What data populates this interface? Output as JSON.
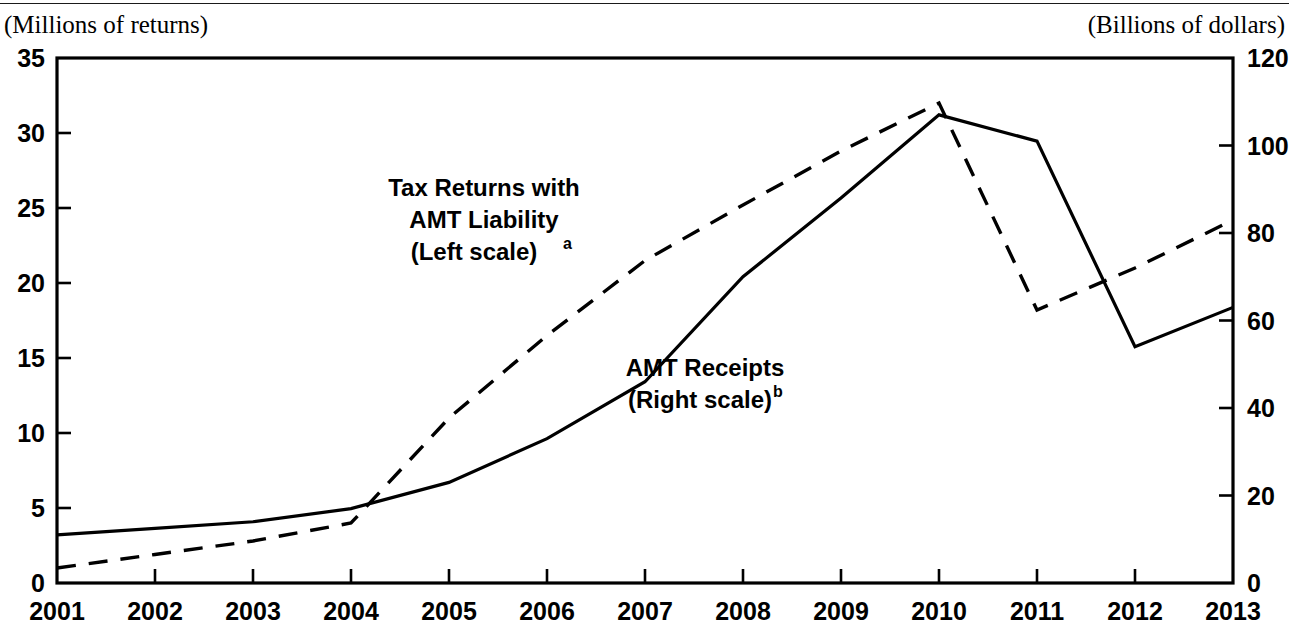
{
  "figure": {
    "left_axis_unit": "(Millions of returns)",
    "right_axis_unit": "(Billions of dollars)",
    "series_labels": {
      "dashed_line1": "Tax Returns with",
      "dashed_line2": "AMT Liability",
      "dashed_line3": "(Left scale)",
      "dashed_footnote": "a",
      "solid_line1": "AMT Receipts",
      "solid_line2": "(Right scale)",
      "solid_footnote": "b"
    }
  },
  "chart_data": {
    "type": "line",
    "title": "",
    "subtitle": "",
    "xlabel": "",
    "ylabel": "(Millions of returns)",
    "y2label": "(Billions of dollars)",
    "grid": false,
    "legend_position": "inline-annotation",
    "x": [
      2001,
      2002,
      2003,
      2004,
      2005,
      2006,
      2007,
      2008,
      2009,
      2010,
      2011,
      2012,
      2013
    ],
    "xtick_labels": [
      "2001",
      "2002",
      "2003",
      "2004",
      "2005",
      "2006",
      "2007",
      "2008",
      "2009",
      "2010",
      "2011",
      "2012",
      "2013"
    ],
    "xlim": [
      2001,
      2013
    ],
    "ylim": [
      0,
      35
    ],
    "ytick_labels": [
      "0",
      "5",
      "10",
      "15",
      "20",
      "25",
      "30",
      "35"
    ],
    "yticks": [
      0,
      5,
      10,
      15,
      20,
      25,
      30,
      35
    ],
    "y2lim": [
      0,
      120
    ],
    "y2tick_labels": [
      "0",
      "20",
      "40",
      "60",
      "80",
      "100",
      "120"
    ],
    "y2ticks": [
      0,
      20,
      40,
      60,
      80,
      100,
      120
    ],
    "series": [
      {
        "name": "Tax Returns with AMT Liability (Left scale)",
        "axis": "left",
        "style": "dashed",
        "units": "millions of returns",
        "values": [
          1.0,
          1.9,
          2.8,
          4.0,
          11.0,
          16.5,
          21.5,
          25.2,
          28.8,
          32.0,
          18.2,
          21.0,
          24.2
        ]
      },
      {
        "name": "AMT Receipts (Right scale)",
        "axis": "right",
        "style": "solid",
        "units": "billions of dollars",
        "values": [
          11.0,
          12.5,
          14.0,
          17.0,
          23.0,
          33.0,
          46.0,
          70.0,
          88.0,
          107.0,
          101.0,
          54.0,
          63.0
        ]
      }
    ]
  }
}
